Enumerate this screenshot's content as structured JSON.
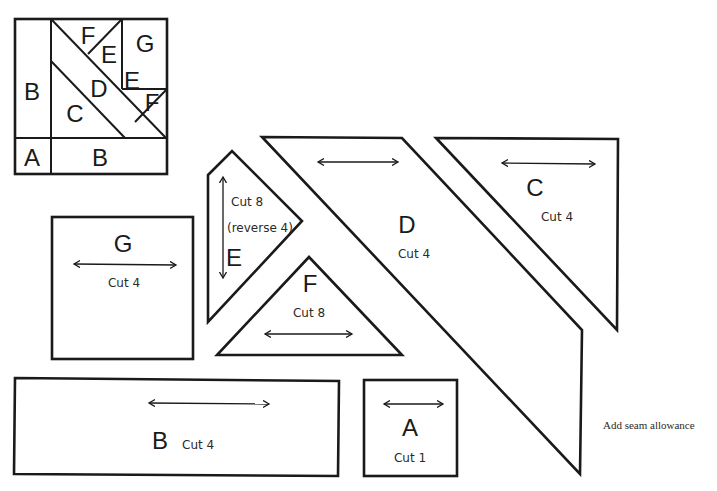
{
  "block_diagram": {
    "labels": {
      "B_left": "B",
      "A": "A",
      "B_bottom": "B",
      "C": "C",
      "D": "D",
      "F_top": "F",
      "E_top": "E",
      "G": "G",
      "E_right": "E",
      "F_right": "F"
    }
  },
  "templates": {
    "G": {
      "letter": "G",
      "cut": "Cut 4"
    },
    "E": {
      "letter": "E",
      "cut": "Cut 8",
      "note": "(reverse 4)"
    },
    "F": {
      "letter": "F",
      "cut": "Cut 8"
    },
    "D": {
      "letter": "D",
      "cut": "Cut 4"
    },
    "C": {
      "letter": "C",
      "cut": "Cut 4"
    },
    "B": {
      "letter": "B",
      "cut": "Cut  4"
    },
    "A": {
      "letter": "A",
      "cut": "Cut 1"
    }
  },
  "footer_note": "Add seam allowance",
  "colors": {
    "ink": "#1a1a1a",
    "paper": "#ffffff"
  }
}
